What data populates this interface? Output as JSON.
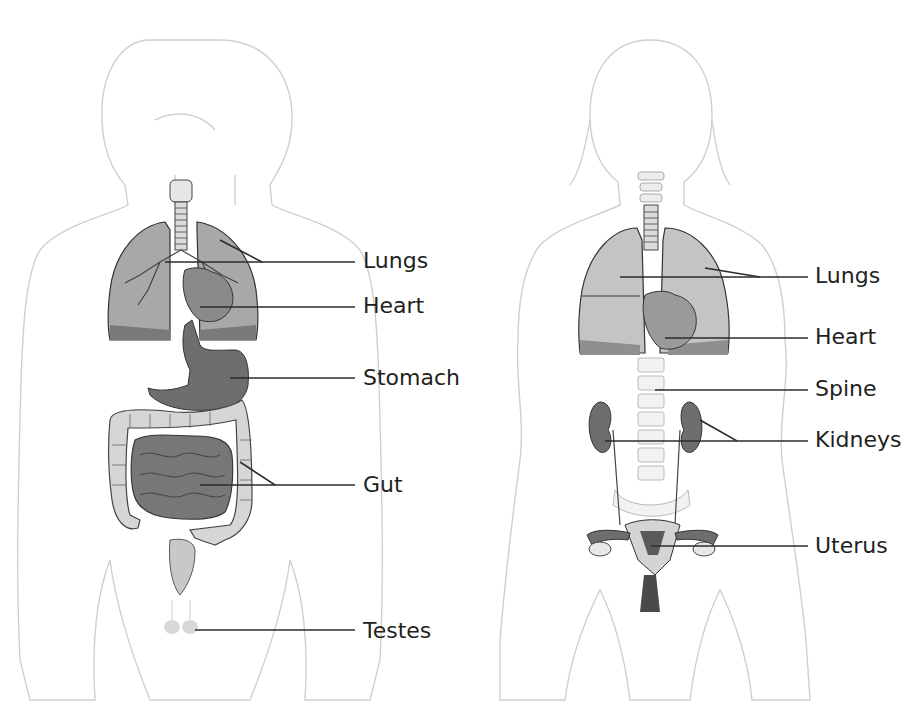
{
  "figure": {
    "type": "anatomical comparison diagram",
    "panels": [
      {
        "id": "male",
        "labels": [
          {
            "text": "Lungs",
            "x": 363,
            "y": 250
          },
          {
            "text": "Heart",
            "x": 363,
            "y": 295
          },
          {
            "text": "Stomach",
            "x": 363,
            "y": 367
          },
          {
            "text": "Gut",
            "x": 363,
            "y": 474
          },
          {
            "text": "Testes",
            "x": 363,
            "y": 620
          }
        ]
      },
      {
        "id": "female",
        "labels": [
          {
            "text": "Lungs",
            "x": 815,
            "y": 265
          },
          {
            "text": "Heart",
            "x": 815,
            "y": 326
          },
          {
            "text": "Spine",
            "x": 815,
            "y": 377
          },
          {
            "text": "Kidneys",
            "x": 815,
            "y": 429
          },
          {
            "text": "Uterus",
            "x": 815,
            "y": 535
          }
        ]
      }
    ],
    "colors": {
      "body_outline": "#cfcfcf",
      "organ_dark": "#6e6e6e",
      "organ_mid": "#9a9a9a",
      "organ_light": "#cccccc",
      "leader_line": "#2b2b2b",
      "label_text": "#231f20"
    }
  },
  "male": {
    "lungs_label": "Lungs",
    "heart_label": "Heart",
    "stomach_label": "Stomach",
    "gut_label": "Gut",
    "testes_label": "Testes"
  },
  "female": {
    "lungs_label": "Lungs",
    "heart_label": "Heart",
    "spine_label": "Spine",
    "kidneys_label": "Kidneys",
    "uterus_label": "Uterus"
  }
}
